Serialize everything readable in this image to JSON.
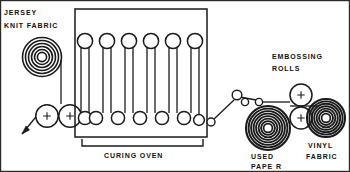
{
  "diagram": {
    "type": "process-flow-schematic",
    "frame": {
      "border_color": "#2a2a2a",
      "background": "#ffffff"
    },
    "line_color": "#1a1a1a",
    "labels": {
      "supply_roll_line1": "JERSEY",
      "supply_roll_line2": "KNIT FABRIC",
      "oven": "CURING  OVEN",
      "used_paper_line1": "USED",
      "used_paper_line2": "PAPE R",
      "embossing_line1": "EMBOSSING",
      "embossing_line2": "ROLLS",
      "vinyl_line1": "VINYL",
      "vinyl_line2": "FABRIC"
    },
    "components": {
      "supply_roll": {
        "name": "jersey-knit-fabric-roll",
        "cx": 42,
        "cy": 57,
        "r_outer": 19,
        "rings": 6,
        "style": "light-spiral"
      },
      "nip_rollers": [
        {
          "name": "nip-roller-1",
          "cx": 47,
          "cy": 116,
          "r": 11,
          "crosshair": true
        },
        {
          "name": "nip-roller-2",
          "cx": 70,
          "cy": 116,
          "r": 11,
          "crosshair": true
        }
      ],
      "oven_box": {
        "x": 75,
        "y": 9,
        "width": 132,
        "height": 128
      },
      "oven_top_rollers_count": 5,
      "oven_bottom_rollers_count": 6,
      "oven_top_roller_r": 7.5,
      "oven_bottom_roller_r": 6.5,
      "guide_rollers": [
        {
          "name": "guide-roller-1",
          "cx": 213,
          "cy": 120,
          "r": 4
        },
        {
          "name": "guide-roller-2",
          "cx": 237,
          "cy": 97,
          "r": 4.5
        },
        {
          "name": "guide-roller-3",
          "cx": 245,
          "cy": 103,
          "r": 3.5
        },
        {
          "name": "guide-roller-4",
          "cx": 259,
          "cy": 103,
          "r": 3.5
        }
      ],
      "used_paper_roll": {
        "name": "used-paper-roll",
        "cx": 268,
        "cy": 128,
        "r_outer": 22,
        "rings": 9,
        "style": "dark-spiral"
      },
      "embossing_rollers": [
        {
          "name": "embossing-roller-upper",
          "cx": 301,
          "cy": 96,
          "r": 11,
          "crosshair": true
        },
        {
          "name": "embossing-roller-lower",
          "cx": 301,
          "cy": 119,
          "r": 11,
          "crosshair": true
        }
      ],
      "vinyl_roll": {
        "name": "vinyl-fabric-roll",
        "cx": 325,
        "cy": 118,
        "r_outer": 19,
        "rings": 8,
        "style": "dark-spiral"
      },
      "feed_arrow": {
        "name": "feed-direction-arrow",
        "from": [
          22,
          134
        ],
        "to": [
          40,
          112
        ]
      },
      "oven_bracket": {
        "y": 145,
        "x1": 82,
        "x2": 203
      }
    }
  }
}
